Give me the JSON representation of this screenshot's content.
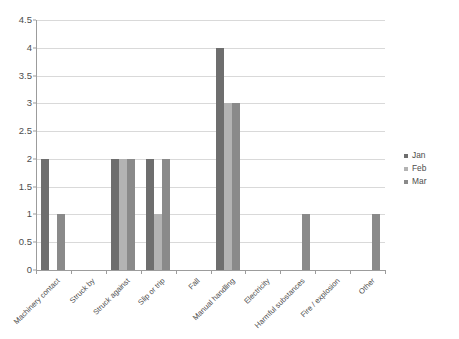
{
  "chart_data": {
    "type": "bar",
    "title": "",
    "subtitle": "",
    "xlabel": "",
    "ylabel": "",
    "ylim": [
      0,
      4.5
    ],
    "ytick_step": 0.5,
    "yticks": [
      "0",
      "0.5",
      "1",
      "1.5",
      "2",
      "2.5",
      "3",
      "3.5",
      "4",
      "4.5"
    ],
    "grid": "horizontal",
    "legend_position": "right",
    "categories": [
      "Machinery contact",
      "Struck by",
      "Struck against",
      "Slip or trip",
      "Fall",
      "Manual handling",
      "Electricity",
      "Harmful substances",
      "Fire / explosion",
      "Other"
    ],
    "series": [
      {
        "name": "Jan",
        "color": "#6e6e6e",
        "values": [
          2,
          0,
          2,
          2,
          0,
          4,
          0,
          0,
          0,
          0
        ]
      },
      {
        "name": "Feb",
        "color": "#b3b3b3",
        "values": [
          0,
          0,
          2,
          1,
          0,
          3,
          0,
          0,
          0,
          0
        ]
      },
      {
        "name": "Mar",
        "color": "#8a8a8a",
        "values": [
          1,
          0,
          2,
          2,
          0,
          3,
          0,
          1,
          0,
          1
        ]
      }
    ]
  },
  "legend": {
    "items": [
      {
        "label": "Jan"
      },
      {
        "label": "Feb"
      },
      {
        "label": "Mar"
      }
    ]
  }
}
